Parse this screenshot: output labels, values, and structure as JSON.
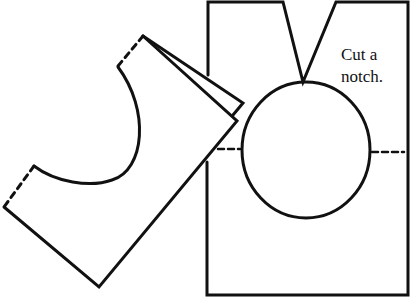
{
  "diagram": {
    "annotation": {
      "line1": "Cut a",
      "line2": "notch."
    },
    "colors": {
      "stroke": "#111111",
      "background": "#ffffff"
    },
    "shapes": [
      {
        "id": "folded-pattern-piece",
        "description": "Folded fabric piece with curved neckline cut-out and dashed fold lines"
      },
      {
        "id": "unfolded-pattern-piece",
        "description": "Rectangular piece with V notch at top and circular neckline with dashed center lines"
      }
    ]
  }
}
